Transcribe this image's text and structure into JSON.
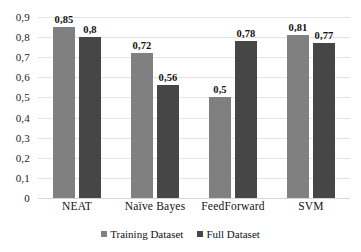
{
  "chart_data": {
    "type": "bar",
    "title": "",
    "subtitle": "",
    "xlabel": "",
    "ylabel": "",
    "categories": [
      "NEAT",
      "Naïve Bayes",
      "FeedForward",
      "SVM"
    ],
    "series": [
      {
        "name": "Training Dataset",
        "color": "#808080",
        "values": [
          0.85,
          0.72,
          0.5,
          0.81
        ],
        "labels": [
          "0,85",
          "0,72",
          "0,5",
          "0,81"
        ]
      },
      {
        "name": "Full Dataset",
        "color": "#464646",
        "values": [
          0.8,
          0.56,
          0.78,
          0.77
        ],
        "labels": [
          "0,8",
          "0,56",
          "0,78",
          "0,77"
        ]
      }
    ],
    "ylim": [
      0,
      0.9
    ],
    "ytick_values": [
      0.9,
      0.8,
      0.7,
      0.6,
      0.5,
      0.4,
      0.3,
      0.2,
      0.1,
      0
    ],
    "ytick_labels": [
      "0,9",
      "0,8",
      "0,7",
      "0,6",
      "0,5",
      "0,4",
      "0,3",
      "0,2",
      "0,1",
      "0"
    ],
    "grid": true,
    "legend_position": "bottom",
    "decimal_separator": ","
  },
  "legend": {
    "items": [
      {
        "label": "Training Dataset",
        "marker": "square-marker-light"
      },
      {
        "label": "Full Dataset",
        "marker": "square-marker-dark"
      }
    ]
  }
}
